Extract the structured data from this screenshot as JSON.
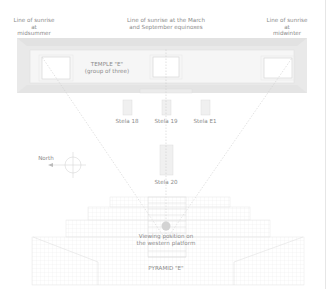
{
  "diagram": {
    "sunrise_lines": {
      "midsummer": "Line of sunrise at\nmidsummer",
      "equinox": "Line of sunrise at the March\nand September equinoxes",
      "midwinter": "Line of sunrise at\nmidwinter"
    },
    "temple": {
      "title": "TEMPLE \"E\"",
      "subtitle": "(group of three)"
    },
    "stelae": [
      "Stela 18",
      "Stela 19",
      "Stela E1",
      "Stela 20"
    ],
    "compass": {
      "label": "North",
      "icon": "compass-icon"
    },
    "viewing_position": "Viewing position on\nthe western platform",
    "pyramid": {
      "title": "PYRAMID \"E\""
    },
    "colors": {
      "line": "#d9d9d9",
      "fill_light": "#f2f2f2",
      "fill_mid": "#e8e8e8",
      "text": "#8a8a8a",
      "viewpoint": "#d0d0d0"
    }
  }
}
